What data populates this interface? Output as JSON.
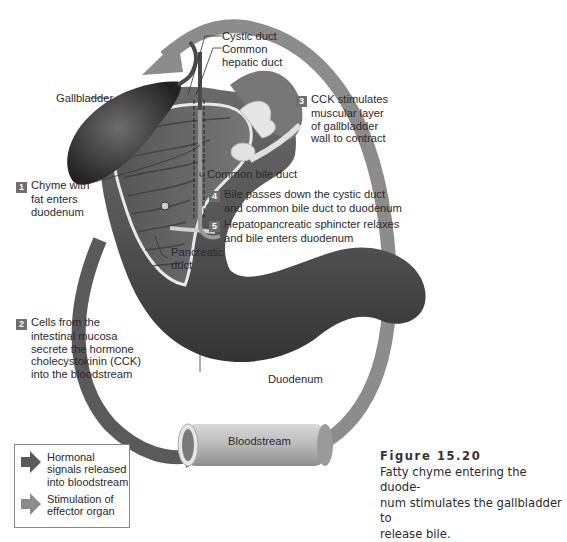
{
  "colors": {
    "hormonal_arrow": "#5a5a5a",
    "effector_arrow": "#8c8c8c",
    "badge_fill": "#6e6e6e",
    "text": "#2a2a2a",
    "organ_dark": "#3a3a3a",
    "organ_mid": "#6a6a6a"
  },
  "labels": {
    "cystic_duct": "Cystic duct",
    "common_hepatic_duct_1": "Common",
    "common_hepatic_duct_2": "hepatic duct",
    "gallbladder": "Gallbladder",
    "common_bile_duct": "Common bile duct",
    "pancreatic_duct_1": "Pancreatic",
    "pancreatic_duct_2": "duct",
    "duodenum": "Duodenum",
    "bloodstream": "Bloodstream"
  },
  "steps": [
    {
      "number": "1",
      "lines": [
        "Chyme with",
        "fat enters",
        "duodenum"
      ]
    },
    {
      "number": "2",
      "lines": [
        "Cells from the",
        "intestinal mucosa",
        "secrete the hormone",
        "cholecystokinin (CCK)",
        "into the bloodstream"
      ]
    },
    {
      "number": "3",
      "lines": [
        "CCK stimulates",
        "muscular layer",
        "of gallbladder",
        "wall to contract"
      ]
    },
    {
      "number": "4",
      "lines": [
        "Bile passes down the cystic duct",
        "and common bile duct to duodenum"
      ]
    },
    {
      "number": "5",
      "lines": [
        "Hepatopancreatic sphincter relaxes",
        "and bile enters duodenum"
      ]
    }
  ],
  "legend": {
    "items": [
      {
        "icon": "dark-arrow",
        "lines": [
          "Hormonal",
          "signals released",
          "into bloodstream"
        ]
      },
      {
        "icon": "light-arrow",
        "lines": [
          "Stimulation of",
          "effector organ"
        ]
      }
    ]
  },
  "caption": {
    "figure": "Figure 15.20",
    "lines": [
      "Fatty chyme entering the duode-",
      "num stimulates the gallbladder to",
      "release bile."
    ]
  }
}
